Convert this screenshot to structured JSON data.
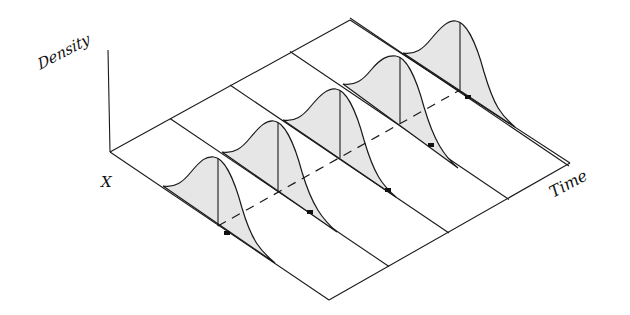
{
  "diagram": {
    "labels": {
      "density": "Density",
      "x": "X",
      "time": "Time"
    },
    "colors": {
      "line": "#1a1a1a",
      "fill": "#e6e6e6",
      "background": "#ffffff"
    },
    "geometry": {
      "origin_back_left": [
        110,
        152
      ],
      "density_axis_top": [
        108,
        50
      ],
      "front_left": [
        329,
        300
      ],
      "back_right": [
        350,
        20
      ],
      "front_right": [
        570,
        163
      ],
      "slice_step": [
        60,
        -33.5
      ],
      "slice_dir": [
        219,
        148
      ]
    },
    "slices": [
      {
        "index": 0,
        "start": [
          163,
          186
        ],
        "peak_top": [
          218,
          158
        ],
        "peak_base": [
          218,
          226
        ],
        "end": [
          275,
          263
        ],
        "dot": [
          227,
          233
        ]
      },
      {
        "index": 1,
        "start": [
          222,
          152
        ],
        "peak_top": [
          278,
          122
        ],
        "peak_base": [
          278,
          191
        ],
        "end": [
          337,
          232
        ],
        "dot": [
          310,
          212
        ]
      },
      {
        "index": 2,
        "start": [
          283,
          120
        ],
        "peak_top": [
          340,
          90
        ],
        "peak_base": [
          340,
          158
        ],
        "end": [
          396,
          197
        ],
        "dot": [
          388,
          190
        ]
      },
      {
        "index": 3,
        "start": [
          343,
          84
        ],
        "peak_top": [
          400,
          57
        ],
        "peak_base": [
          400,
          123
        ],
        "end": [
          458,
          168
        ],
        "dot": [
          431,
          145
        ]
      },
      {
        "index": 4,
        "start": [
          403,
          53
        ],
        "peak_top": [
          460,
          22
        ],
        "peak_base": [
          460,
          90
        ],
        "end": [
          515,
          127
        ],
        "dot": [
          468,
          97
        ]
      }
    ],
    "dashed_trend": {
      "from": [
        218,
        226
      ],
      "to": [
        460,
        90
      ]
    }
  }
}
